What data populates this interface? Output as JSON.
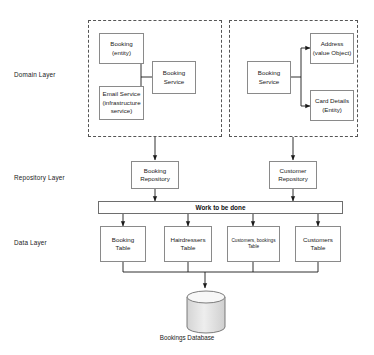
{
  "diagram": {
    "layers": [
      {
        "id": "domain",
        "label": "Domain Layer"
      },
      {
        "id": "repository",
        "label": "Repository Layer"
      },
      {
        "id": "data",
        "label": "Data Layer"
      }
    ],
    "domain_left": {
      "booking_entity": {
        "line1": "Booking",
        "line2": "(entity)"
      },
      "email_service": {
        "line1": "Email Service",
        "line2": "(infrastructure",
        "line3": "service)"
      },
      "booking_service": {
        "line1": "Booking",
        "line2": "Service"
      }
    },
    "domain_right": {
      "booking_service": {
        "line1": "Booking",
        "line2": "Service"
      },
      "address": {
        "line1": "Address",
        "line2": "(value Object)"
      },
      "card_details": {
        "line1": "Card Details",
        "line2": "(Entity)"
      }
    },
    "repository": {
      "booking_repository": {
        "line1": "Booking",
        "line2": "Repository"
      },
      "customer_repository": {
        "line1": "Customer",
        "line2": "Repository"
      }
    },
    "work_bar": {
      "label": "Work to be done"
    },
    "data_tables": [
      {
        "id": "booking-table",
        "line1": "Booking",
        "line2": "Table",
        "small": false
      },
      {
        "id": "hairdressers-table",
        "line1": "Hairdressers",
        "line2": "Table",
        "small": false
      },
      {
        "id": "customers-bookings-table",
        "line1": "Customers, bookings",
        "line2": "Table",
        "small": true
      },
      {
        "id": "customers-table",
        "line1": "Customers",
        "line2": "Table",
        "small": false
      }
    ],
    "database": {
      "caption": "Bookings Database"
    },
    "colors": {
      "node_border": "#8a8a8a",
      "group_border": "#555555",
      "bar_border": "#6e6e6e",
      "connector": "#1a1a1a",
      "cylinder_fill": "#e2e2e2",
      "background": "#ffffff",
      "text": "#1a1a1a"
    }
  }
}
